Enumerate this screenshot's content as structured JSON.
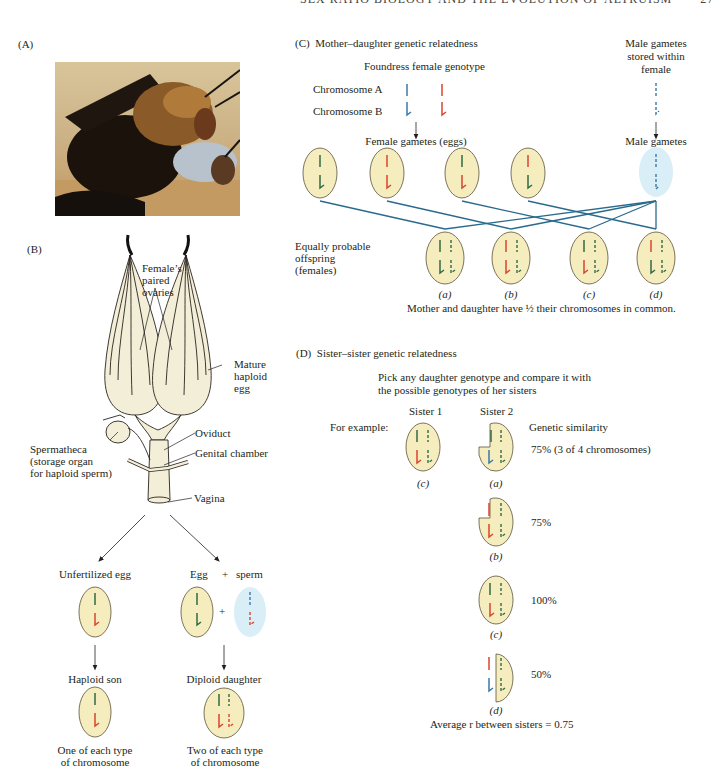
{
  "header": {
    "running_title": "SEX RATIO BIOLOGY AND THE EVOLUTION OF ALTRUISM",
    "page_number": "27"
  },
  "colors": {
    "cell_fill": "#f6edbf",
    "cell_stroke": "#5b5238",
    "male_cell_fill": "#d9eef6",
    "chrom_blue": "#3a79a8",
    "chrom_red": "#d9442f",
    "chrom_green": "#2f6b45",
    "line_blue": "#2a6a8c",
    "ovary_fill": "#f3eed8"
  },
  "panel_a": {
    "label": "(A)",
    "image_alt": "Photograph of a pair of bees mating on sand"
  },
  "panel_b": {
    "label": "(B)",
    "annotations": {
      "ovaries": [
        "Female’s",
        "paired",
        "ovaries"
      ],
      "egg": [
        "Mature",
        "haploid",
        "egg"
      ],
      "oviduct": "Oviduct",
      "genital_chamber": "Genital chamber",
      "spermatheca": [
        "Spermatheca",
        "(storage organ",
        "for haploid sperm)"
      ],
      "vagina": "Vagina"
    },
    "left_path": {
      "top_label": "Unfertilized egg",
      "result_label": "Haploid son",
      "caption": [
        "One of each type",
        "of chromosome"
      ]
    },
    "right_path": {
      "egg_label": "Egg",
      "plus": "+",
      "sperm_label": "sperm",
      "result_label": "Diploid daughter",
      "caption": [
        "Two of each type",
        "of chromosome"
      ]
    }
  },
  "panel_c": {
    "label": "(C)",
    "title": "Mother–daughter genetic relatedness",
    "foundress_label": "Foundress female genotype",
    "chromosome_a": "Chromosome A",
    "chromosome_b": "Chromosome B",
    "male_stored": [
      "Male gametes",
      "stored within",
      "female"
    ],
    "female_gametes_label": "Female gametes (eggs)",
    "male_gametes_label": "Male gametes",
    "female_gametes": [
      {
        "a": "green",
        "b": "green"
      },
      {
        "a": "red",
        "b": "red"
      },
      {
        "a": "green",
        "b": "red"
      },
      {
        "a": "red",
        "b": "green"
      }
    ],
    "offspring_label": [
      "Equally probable",
      "offspring",
      "(females)"
    ],
    "offspring": [
      {
        "id": "(a)",
        "maternal_a": "green",
        "maternal_b": "green"
      },
      {
        "id": "(b)",
        "maternal_a": "red",
        "maternal_b": "red"
      },
      {
        "id": "(c)",
        "maternal_a": "green",
        "maternal_b": "red"
      },
      {
        "id": "(d)",
        "maternal_a": "red",
        "maternal_b": "green"
      }
    ],
    "conclusion": "Mother and daughter have ½ their chromosomes in common."
  },
  "panel_d": {
    "label": "(D)",
    "title": "Sister–sister genetic relatedness",
    "instruction": [
      "Pick any daughter genotype and compare it with",
      "the possible genotypes of her sisters"
    ],
    "sister1_label": "Sister 1",
    "sister2_label": "Sister 2",
    "for_example": "For example:",
    "similarity_header": "Genetic similarity",
    "sister1_id": "(c)",
    "comparisons": [
      {
        "id": "(a)",
        "similarity": "75% (3 of 4 chromosomes)"
      },
      {
        "id": "(b)",
        "similarity": "75%"
      },
      {
        "id": "(c)",
        "similarity": "100%"
      },
      {
        "id": "(d)",
        "similarity": "50%"
      }
    ],
    "average": "Average r between sisters = 0.75"
  }
}
